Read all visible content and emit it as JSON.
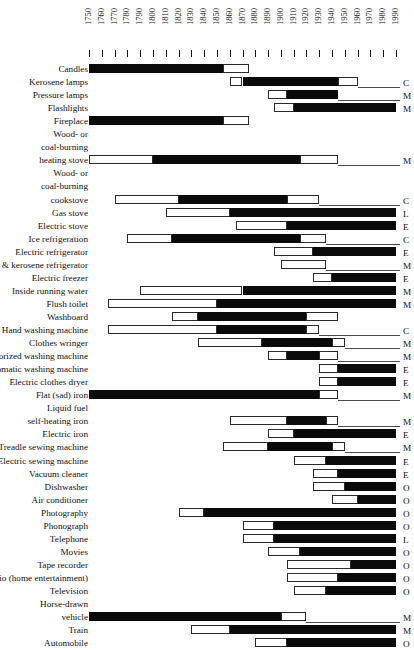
{
  "chart_data": {
    "type": "bar",
    "title": "",
    "subtitle": "",
    "xlabel": "",
    "ylabel": "",
    "xlim": [
      1745,
      1995
    ],
    "grid": false,
    "legend_position": "none",
    "axis_ticks": [
      1750,
      1760,
      1770,
      1780,
      1790,
      1800,
      1810,
      1820,
      1830,
      1840,
      1850,
      1860,
      1870,
      1880,
      1890,
      1900,
      1910,
      1920,
      1930,
      1940,
      1950,
      1960,
      1970,
      1980,
      1990
    ],
    "segment_legend": {
      "white": "introduction / decline phase (open bar)",
      "black": "period of widespread use (solid bar)"
    },
    "categories": [
      "Candles",
      "Kerosene lamps",
      "Pressure lamps",
      "Flashlights",
      "Fireplace",
      "Wood- or coal-burning heating stove",
      "Wood- or coal-burning cookstove",
      "Gas stove",
      "Electric stove",
      "Ice refrigeration",
      "Electric refrigerator",
      "Gas & kerosene refrigerator",
      "Electric freezer",
      "Inside running water",
      "Flush toilet",
      "Washboard",
      "Hand washing machine",
      "Clothes wringer",
      "Motorized washing machine",
      "Automatic washing machine",
      "Electric clothes dryer",
      "Flat (sad) iron",
      "Liquid fuel self-heating iron",
      "Electric iron",
      "Treadle sewing machine",
      "Electric sewing machine",
      "Vacuum cleaner",
      "Dishwasher",
      "Air conditioner",
      "Photography",
      "Phonograph",
      "Telephone",
      "Movies",
      "Tape recorder",
      "Radio (home entertainment)",
      "Television",
      "Horse-drawn vehicle",
      "Train",
      "Automobile"
    ],
    "rows": [
      {
        "label": "Candles",
        "label_lines": [
          "Candles"
        ],
        "indent": false,
        "start": 1750,
        "black_start": 1750,
        "black_end": 1855,
        "end": 1875,
        "end_letter": "",
        "open_right": false
      },
      {
        "label": "Kerosene lamps",
        "label_lines": [
          "Kerosene lamps"
        ],
        "indent": false,
        "start": 1860,
        "black_start": 1870,
        "black_end": 1945,
        "end": 1960,
        "end_letter": "C",
        "open_right": false
      },
      {
        "label": "Pressure lamps",
        "label_lines": [
          "Pressure lamps"
        ],
        "indent": false,
        "start": 1890,
        "black_start": 1905,
        "black_end": 1945,
        "end": 1945,
        "end_letter": "M",
        "open_right": false
      },
      {
        "label": "Flashlights",
        "label_lines": [
          "Flashlights"
        ],
        "indent": false,
        "start": 1895,
        "black_start": 1910,
        "black_end": 1990,
        "end": 1990,
        "end_letter": "M",
        "open_right": true
      },
      {
        "label": "Fireplace",
        "label_lines": [
          "Fireplace"
        ],
        "indent": false,
        "start": 1750,
        "black_start": 1750,
        "black_end": 1855,
        "end": 1875,
        "end_letter": "",
        "open_right": false
      },
      {
        "label": "Wood- or coal-burning heating stove",
        "label_lines": [
          "Wood- or",
          "coal-burning",
          "heating stove"
        ],
        "indent": true,
        "start": 1750,
        "black_start": 1800,
        "black_end": 1915,
        "end": 1945,
        "end_letter": "M",
        "open_right": false
      },
      {
        "label": "Wood- or coal-burning cookstove",
        "label_lines": [
          "Wood- or",
          "coal-burning",
          "cookstove"
        ],
        "indent": true,
        "start": 1770,
        "black_start": 1820,
        "black_end": 1905,
        "end": 1930,
        "end_letter": "C",
        "open_right": false
      },
      {
        "label": "Gas stove",
        "label_lines": [
          "Gas stove"
        ],
        "indent": false,
        "start": 1810,
        "black_start": 1860,
        "black_end": 1990,
        "end": 1990,
        "end_letter": "L",
        "open_right": true
      },
      {
        "label": "Electric stove",
        "label_lines": [
          "Electric stove"
        ],
        "indent": false,
        "start": 1865,
        "black_start": 1905,
        "black_end": 1990,
        "end": 1990,
        "end_letter": "E",
        "open_right": true
      },
      {
        "label": "Ice refrigeration",
        "label_lines": [
          "Ice refrigeration"
        ],
        "indent": false,
        "start": 1780,
        "black_start": 1815,
        "black_end": 1915,
        "end": 1935,
        "end_letter": "C",
        "open_right": false
      },
      {
        "label": "Electric refrigerator",
        "label_lines": [
          "Electric refrigerator"
        ],
        "indent": false,
        "start": 1895,
        "black_start": 1925,
        "black_end": 1990,
        "end": 1990,
        "end_letter": "E",
        "open_right": true
      },
      {
        "label": "Gas & kerosene refrigerator",
        "label_lines": [
          "Gas & kerosene refrigerator"
        ],
        "indent": false,
        "start": 1900,
        "black_start": 1900,
        "black_end": 1900,
        "end": 1935,
        "end_letter": "M",
        "open_right": false
      },
      {
        "label": "Electric freezer",
        "label_lines": [
          "Electric freezer"
        ],
        "indent": false,
        "start": 1925,
        "black_start": 1940,
        "black_end": 1990,
        "end": 1990,
        "end_letter": "E",
        "open_right": true
      },
      {
        "label": "Inside running water",
        "label_lines": [
          "Inside running water"
        ],
        "indent": false,
        "start": 1790,
        "black_start": 1870,
        "black_end": 1990,
        "end": 1990,
        "end_letter": "M",
        "open_right": true
      },
      {
        "label": "Flush toilet",
        "label_lines": [
          "Flush toilet"
        ],
        "indent": false,
        "start": 1765,
        "black_start": 1850,
        "black_end": 1990,
        "end": 1990,
        "end_letter": "M",
        "open_right": true
      },
      {
        "label": "Washboard",
        "label_lines": [
          "Washboard"
        ],
        "indent": false,
        "start": 1815,
        "black_start": 1835,
        "black_end": 1920,
        "end": 1945,
        "end_letter": "",
        "open_right": false
      },
      {
        "label": "Hand washing machine",
        "label_lines": [
          "Hand washing machine"
        ],
        "indent": false,
        "start": 1765,
        "black_start": 1850,
        "black_end": 1920,
        "end": 1930,
        "end_letter": "C",
        "open_right": false
      },
      {
        "label": "Clothes wringer",
        "label_lines": [
          "Clothes wringer"
        ],
        "indent": false,
        "start": 1835,
        "black_start": 1885,
        "black_end": 1940,
        "end": 1950,
        "end_letter": "M",
        "open_right": false
      },
      {
        "label": "Motorized washing machine",
        "label_lines": [
          "Motorized washing machine"
        ],
        "indent": false,
        "start": 1890,
        "black_start": 1905,
        "black_end": 1930,
        "end": 1945,
        "end_letter": "M",
        "open_right": false
      },
      {
        "label": "Automatic washing machine",
        "label_lines": [
          "Automatic washing machine"
        ],
        "indent": false,
        "start": 1930,
        "black_start": 1945,
        "black_end": 1990,
        "end": 1990,
        "end_letter": "E",
        "open_right": true
      },
      {
        "label": "Electric clothes dryer",
        "label_lines": [
          "Electric clothes dryer"
        ],
        "indent": false,
        "start": 1930,
        "black_start": 1945,
        "black_end": 1990,
        "end": 1990,
        "end_letter": "E",
        "open_right": true
      },
      {
        "label": "Flat (sad) iron",
        "label_lines": [
          "Flat (sad) iron"
        ],
        "indent": false,
        "start": 1750,
        "black_start": 1750,
        "black_end": 1930,
        "end": 1945,
        "end_letter": "M",
        "open_right": false
      },
      {
        "label": "Liquid fuel self-heating iron",
        "label_lines": [
          "Liquid fuel",
          "self-heating iron"
        ],
        "indent": true,
        "start": 1860,
        "black_start": 1905,
        "black_end": 1935,
        "end": 1945,
        "end_letter": "M",
        "open_right": false
      },
      {
        "label": "Electric iron",
        "label_lines": [
          "Electric iron"
        ],
        "indent": false,
        "start": 1890,
        "black_start": 1910,
        "black_end": 1990,
        "end": 1990,
        "end_letter": "E",
        "open_right": true
      },
      {
        "label": "Treadle sewing machine",
        "label_lines": [
          "Treadle sewing machine"
        ],
        "indent": false,
        "start": 1855,
        "black_start": 1890,
        "black_end": 1940,
        "end": 1950,
        "end_letter": "M",
        "open_right": false
      },
      {
        "label": "Electric sewing machine",
        "label_lines": [
          "Electric sewing machine"
        ],
        "indent": false,
        "start": 1910,
        "black_start": 1935,
        "black_end": 1990,
        "end": 1990,
        "end_letter": "E",
        "open_right": true
      },
      {
        "label": "Vacuum cleaner",
        "label_lines": [
          "Vacuum cleaner"
        ],
        "indent": false,
        "start": 1925,
        "black_start": 1945,
        "black_end": 1990,
        "end": 1990,
        "end_letter": "E",
        "open_right": true
      },
      {
        "label": "Dishwasher",
        "label_lines": [
          "Dishwasher"
        ],
        "indent": false,
        "start": 1925,
        "black_start": 1950,
        "black_end": 1990,
        "end": 1990,
        "end_letter": "O",
        "open_right": true
      },
      {
        "label": "Air conditioner",
        "label_lines": [
          "Air conditioner"
        ],
        "indent": false,
        "start": 1940,
        "black_start": 1960,
        "black_end": 1990,
        "end": 1990,
        "end_letter": "O",
        "open_right": true
      },
      {
        "label": "Photography",
        "label_lines": [
          "Photography"
        ],
        "indent": false,
        "start": 1820,
        "black_start": 1840,
        "black_end": 1990,
        "end": 1990,
        "end_letter": "O",
        "open_right": true
      },
      {
        "label": "Phonograph",
        "label_lines": [
          "Phonograph"
        ],
        "indent": false,
        "start": 1870,
        "black_start": 1895,
        "black_end": 1990,
        "end": 1990,
        "end_letter": "O",
        "open_right": true
      },
      {
        "label": "Telephone",
        "label_lines": [
          "Telephone"
        ],
        "indent": false,
        "start": 1870,
        "black_start": 1895,
        "black_end": 1990,
        "end": 1990,
        "end_letter": "L",
        "open_right": true
      },
      {
        "label": "Movies",
        "label_lines": [
          "Movies"
        ],
        "indent": false,
        "start": 1890,
        "black_start": 1915,
        "black_end": 1990,
        "end": 1990,
        "end_letter": "O",
        "open_right": true
      },
      {
        "label": "Tape recorder",
        "label_lines": [
          "Tape recorder"
        ],
        "indent": false,
        "start": 1905,
        "black_start": 1955,
        "black_end": 1990,
        "end": 1990,
        "end_letter": "O",
        "open_right": true
      },
      {
        "label": "Radio (home entertainment)",
        "label_lines": [
          "Radio (home entertainment)"
        ],
        "indent": false,
        "start": 1905,
        "black_start": 1945,
        "black_end": 1990,
        "end": 1990,
        "end_letter": "O",
        "open_right": true
      },
      {
        "label": "Television",
        "label_lines": [
          "Television"
        ],
        "indent": false,
        "start": 1910,
        "black_start": 1935,
        "black_end": 1990,
        "end": 1990,
        "end_letter": "O",
        "open_right": true
      },
      {
        "label": "Horse-drawn vehicle",
        "label_lines": [
          "Horse-drawn",
          "vehicle"
        ],
        "indent": true,
        "start": 1750,
        "black_start": 1750,
        "black_end": 1900,
        "end": 1920,
        "end_letter": "M",
        "open_right": false
      },
      {
        "label": "Train",
        "label_lines": [
          "Train"
        ],
        "indent": false,
        "start": 1830,
        "black_start": 1860,
        "black_end": 1990,
        "end": 1990,
        "end_letter": "M",
        "open_right": true
      },
      {
        "label": "Automobile",
        "label_lines": [
          "Automobile"
        ],
        "indent": false,
        "start": 1880,
        "black_start": 1905,
        "black_end": 1990,
        "end": 1990,
        "end_letter": "O",
        "open_right": true
      }
    ]
  }
}
